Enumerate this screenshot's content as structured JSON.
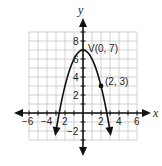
{
  "chart_data": {
    "type": "line",
    "title": "",
    "xlabel": "x",
    "ylabel": "y",
    "xlim": [
      -6,
      6
    ],
    "ylim": [
      -3,
      9
    ],
    "grid": true,
    "x_ticks": [
      -6,
      -4,
      -2,
      2,
      4,
      6
    ],
    "x_tick_labels": [
      "−6",
      "−4",
      "2",
      "2",
      "4",
      "6"
    ],
    "y_ticks": [
      8,
      6,
      4,
      2,
      -2
    ],
    "y_tick_labels": [
      "8",
      "6",
      "4",
      "2",
      "−2"
    ],
    "series": [
      {
        "name": "parabola",
        "equation": "y = -x^2 + 7",
        "x": [
          -3.08,
          -3,
          -2,
          -1,
          0,
          1,
          2,
          3,
          3.08
        ],
        "y": [
          -2.5,
          -2,
          3,
          6,
          7,
          6,
          3,
          -2,
          -2.5
        ],
        "arrows_at_ends": true
      }
    ],
    "points": [
      {
        "label": "V(0, 7)",
        "x": 0,
        "y": 7,
        "marker": false
      },
      {
        "label": "(2, 3)",
        "x": 2,
        "y": 3,
        "marker": true
      }
    ],
    "annotations": [
      "V(0, 7)",
      "(2, 3)"
    ]
  },
  "labels": {
    "x_axis": "x",
    "y_axis": "y",
    "vertex": "V(0, 7)",
    "point": "(2, 3)",
    "xt": [
      "−6",
      "−4",
      "2",
      "2",
      "4",
      "6"
    ],
    "yt": [
      "8",
      "6",
      "4",
      "2",
      "−2"
    ]
  }
}
